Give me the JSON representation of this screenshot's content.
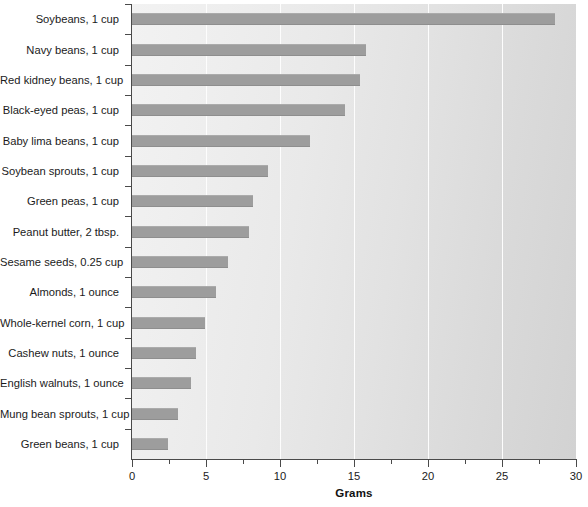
{
  "chart_data": {
    "type": "bar",
    "orientation": "horizontal",
    "title": "",
    "xlabel": "Grams",
    "ylabel": "",
    "xlim": [
      0,
      30
    ],
    "xticks": [
      0,
      5,
      10,
      15,
      20,
      25,
      30
    ],
    "xticklabels": [
      "0",
      "5",
      "10",
      "15",
      "20",
      "25",
      "30"
    ],
    "minor_xticks": [
      2.5,
      7.5,
      12.5,
      17.5,
      22.5,
      27.5
    ],
    "grid": "vertical-white-gridlines-at-major-ticks",
    "legend": "none",
    "bar_color": "#9d9d9d",
    "plot_background": "#e8e8e8",
    "categories": [
      "Soybeans, 1 cup",
      "Navy beans, 1 cup",
      "Red kidney beans, 1 cup",
      "Black-eyed peas, 1 cup",
      "Baby lima beans, 1 cup",
      "Soybean sprouts, 1 cup",
      "Green peas, 1 cup",
      "Peanut butter, 2 tbsp.",
      "Sesame seeds, 0.25 cup",
      "Almonds, 1 ounce",
      "Whole-kernel corn, 1 cup",
      "Cashew nuts, 1 ounce",
      "English walnuts, 1 ounce",
      "Mung bean sprouts, 1 cup",
      "Green beans, 1 cup"
    ],
    "values": [
      28.6,
      15.8,
      15.4,
      14.4,
      12.0,
      9.2,
      8.2,
      7.9,
      6.5,
      5.7,
      4.9,
      4.3,
      4.0,
      3.1,
      2.4
    ]
  }
}
